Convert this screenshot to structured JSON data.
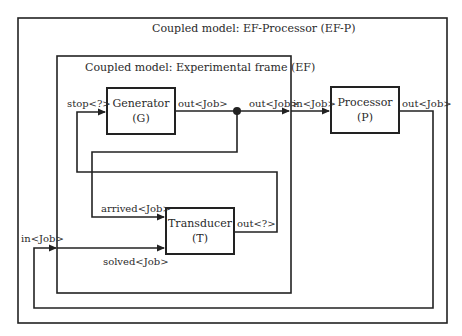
{
  "diagram": {
    "outer_model": {
      "title": "Coupled model: EF-Processor (EF-P)"
    },
    "ef_model": {
      "title": "Coupled model: Experimental frame (EF)"
    },
    "components": {
      "generator": {
        "name": "Generator",
        "abbr": "(G)"
      },
      "transducer": {
        "name": "Transducer",
        "abbr": "(T)"
      },
      "processor": {
        "name": "Processor",
        "abbr": "(P)"
      }
    },
    "ports": {
      "gen_stop": "stop<?>",
      "gen_out": "out<Job>",
      "ef_out": "out<Job>",
      "proc_in": "in<Job>",
      "proc_out": "out<Job>",
      "trans_arrived": "arrived<Job>",
      "trans_out": "out<?>",
      "ef_in": "in<Job>",
      "trans_solved": "solved<Job>"
    },
    "colors": {
      "line": "#222222",
      "background": "#ffffff"
    }
  }
}
